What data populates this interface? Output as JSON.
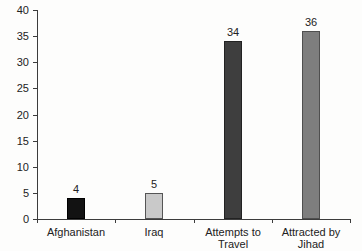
{
  "chart_data": {
    "type": "bar",
    "title": "",
    "xlabel": "",
    "ylabel": "",
    "categories": [
      "Afghanistan",
      "Iraq",
      "Attempts to Travel",
      "Attracted by Jihad"
    ],
    "category_labels_wrapped": [
      "Afghanistan",
      "Iraq",
      "Attempts to\nTravel",
      "Attracted by\nJihad"
    ],
    "values": [
      4,
      5,
      34,
      36
    ],
    "value_labels": [
      "4",
      "5",
      "34",
      "36"
    ],
    "bar_colors": [
      "#121212",
      "#c9c9c9",
      "#3e3e3e",
      "#7e7e7e"
    ],
    "bar_border_colors": [
      "#000000",
      "#555555",
      "#222222",
      "#4f4f4f"
    ],
    "ylim": [
      0,
      40
    ],
    "yticks": [
      0,
      5,
      10,
      15,
      20,
      25,
      30,
      35,
      40
    ],
    "grid": false,
    "legend": null,
    "axis_color": "#3c3c3c",
    "text_color": "#222222"
  }
}
